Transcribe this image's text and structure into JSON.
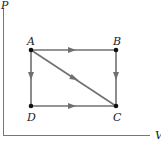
{
  "diagram": {
    "type": "PV diagram",
    "axes": {
      "y_label": "P",
      "x_label": "V"
    },
    "points": [
      {
        "id": "A",
        "label": "A",
        "x": 31,
        "y": 50
      },
      {
        "id": "B",
        "label": "B",
        "x": 116,
        "y": 50
      },
      {
        "id": "C",
        "label": "C",
        "x": 116,
        "y": 106
      },
      {
        "id": "D",
        "label": "D",
        "x": 31,
        "y": 106
      }
    ],
    "paths": [
      {
        "from": "A",
        "to": "B"
      },
      {
        "from": "B",
        "to": "C"
      },
      {
        "from": "A",
        "to": "D"
      },
      {
        "from": "D",
        "to": "C"
      },
      {
        "from": "A",
        "to": "C"
      }
    ],
    "colors": {
      "axis": "#777777",
      "path": "#707070",
      "point": "#111111",
      "label": "#222222"
    }
  }
}
